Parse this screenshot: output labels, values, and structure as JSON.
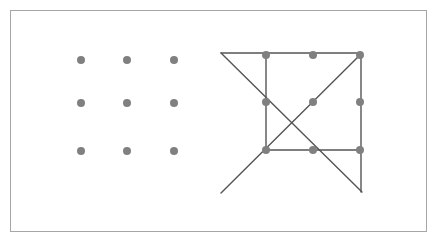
{
  "figure": {
    "background_color": "#ffffff",
    "border_color": "#a6a6a6",
    "dot_color": "#808080",
    "line_color": "#555555",
    "dot_radius": 4,
    "line_width": 1.4,
    "frame": {
      "x": 10,
      "y": 10,
      "width": 417,
      "height": 222
    }
  },
  "panels": [
    {
      "name": "unsolved-grid",
      "label": "Nine dot grid",
      "dot_spacing_x": 46,
      "dot_spacing_y": 46,
      "dots": [
        {
          "id": "L-r1c1",
          "x": 81,
          "y": 60
        },
        {
          "id": "L-r1c2",
          "x": 127,
          "y": 60
        },
        {
          "id": "L-r1c3",
          "x": 174,
          "y": 60
        },
        {
          "id": "L-r2c1",
          "x": 81,
          "y": 103
        },
        {
          "id": "L-r2c2",
          "x": 127,
          "y": 103
        },
        {
          "id": "L-r2c3",
          "x": 174,
          "y": 103
        },
        {
          "id": "L-r3c1",
          "x": 81,
          "y": 151
        },
        {
          "id": "L-r3c2",
          "x": 127,
          "y": 151
        },
        {
          "id": "L-r3c3",
          "x": 174,
          "y": 151
        }
      ],
      "lines": []
    },
    {
      "name": "solution-grid",
      "label": "Four line solution",
      "dot_spacing_x": 47,
      "dot_spacing_y": 47,
      "dots": [
        {
          "id": "R-r1c1",
          "x": 266,
          "y": 55
        },
        {
          "id": "R-r1c2",
          "x": 313,
          "y": 55
        },
        {
          "id": "R-r1c3",
          "x": 360,
          "y": 55
        },
        {
          "id": "R-r2c1",
          "x": 266,
          "y": 102
        },
        {
          "id": "R-r2c2",
          "x": 313,
          "y": 102
        },
        {
          "id": "R-r2c3",
          "x": 360,
          "y": 102
        },
        {
          "id": "R-r3c1",
          "x": 266,
          "y": 150
        },
        {
          "id": "R-r3c2",
          "x": 313,
          "y": 150
        },
        {
          "id": "R-r3c3",
          "x": 360,
          "y": 150
        }
      ],
      "lines": [
        {
          "id": "stroke-1",
          "label": "top horizontal overshoot",
          "x1": 221,
          "y1": 53,
          "x2": 362,
          "y2": 53
        },
        {
          "id": "stroke-2",
          "label": "right vertical overshoot",
          "x1": 361,
          "y1": 53,
          "x2": 361,
          "y2": 192
        },
        {
          "id": "stroke-3",
          "label": "bottom horizontal",
          "x1": 265,
          "y1": 150,
          "x2": 361,
          "y2": 150
        },
        {
          "id": "stroke-4",
          "label": "left vertical",
          "x1": 266,
          "y1": 55,
          "x2": 266,
          "y2": 150
        },
        {
          "id": "stroke-5",
          "label": "diagonal down-right from top-left overshoot",
          "x1": 221,
          "y1": 53,
          "x2": 362,
          "y2": 192
        },
        {
          "id": "stroke-6",
          "label": "diagonal up-right to top-right corner",
          "x1": 221,
          "y1": 193,
          "x2": 361,
          "y2": 54
        }
      ]
    }
  ]
}
